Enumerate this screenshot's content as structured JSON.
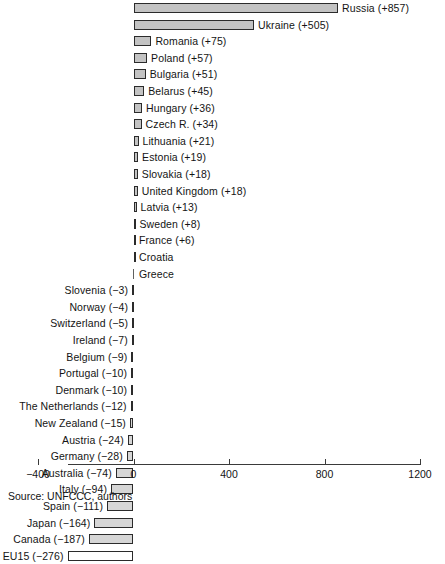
{
  "chart_data": {
    "type": "bar",
    "orientation": "horizontal",
    "title": "",
    "xlabel": "",
    "ylabel": "",
    "xlim": [
      -400,
      1200
    ],
    "xticks": [
      -400,
      0,
      400,
      800,
      1200
    ],
    "xtick_labels": [
      "−400",
      "0",
      "400",
      "800",
      "1200"
    ],
    "grid": false,
    "legend": "none",
    "categories": [
      "Russia",
      "Ukraine",
      "Romania",
      "Poland",
      "Bulgaria",
      "Belarus",
      "Hungary",
      "Czech R.",
      "Lithuania",
      "Estonia",
      "Slovakia",
      "United Kingdom",
      "Latvia",
      "Sweden",
      "France",
      "Croatia",
      "Greece",
      "Slovenia",
      "Norway",
      "Switzerland",
      "Ireland",
      "Belgium",
      "Portugal",
      "Denmark",
      "The Netherlands",
      "New Zealand",
      "Austria",
      "Germany",
      "Australia",
      "Italy",
      "Spain",
      "Japan",
      "Canada",
      "EU15"
    ],
    "values": [
      857,
      505,
      75,
      57,
      51,
      45,
      36,
      34,
      21,
      19,
      18,
      18,
      13,
      8,
      6,
      1,
      0,
      -3,
      -4,
      -5,
      -7,
      -9,
      -10,
      -10,
      -12,
      -15,
      -24,
      -28,
      -74,
      -94,
      -111,
      -164,
      -187,
      -276
    ],
    "bars": [
      {
        "name": "Russia",
        "value": 857,
        "label": "Russia (+857)"
      },
      {
        "name": "Ukraine",
        "value": 505,
        "label": "Ukraine (+505)"
      },
      {
        "name": "Romania",
        "value": 75,
        "label": "Romania (+75)"
      },
      {
        "name": "Poland",
        "value": 57,
        "label": "Poland (+57)"
      },
      {
        "name": "Bulgaria",
        "value": 51,
        "label": "Bulgaria (+51)"
      },
      {
        "name": "Belarus",
        "value": 45,
        "label": "Belarus (+45)"
      },
      {
        "name": "Hungary",
        "value": 36,
        "label": "Hungary (+36)"
      },
      {
        "name": "Czech R.",
        "value": 34,
        "label": "Czech R. (+34)"
      },
      {
        "name": "Lithuania",
        "value": 21,
        "label": "Lithuania (+21)"
      },
      {
        "name": "Estonia",
        "value": 19,
        "label": "Estonia (+19)"
      },
      {
        "name": "Slovakia",
        "value": 18,
        "label": "Slovakia (+18)"
      },
      {
        "name": "United Kingdom",
        "value": 18,
        "label": "United Kingdom (+18)"
      },
      {
        "name": "Latvia",
        "value": 13,
        "label": "Latvia (+13)"
      },
      {
        "name": "Sweden",
        "value": 8,
        "label": "Sweden (+8)"
      },
      {
        "name": "France",
        "value": 6,
        "label": "France (+6)"
      },
      {
        "name": "Croatia",
        "value": 1,
        "label": "Croatia"
      },
      {
        "name": "Greece",
        "value": 0,
        "label": "Greece"
      },
      {
        "name": "Slovenia",
        "value": -3,
        "label": "Slovenia (−3)"
      },
      {
        "name": "Norway",
        "value": -4,
        "label": "Norway (−4)"
      },
      {
        "name": "Switzerland",
        "value": -5,
        "label": "Switzerland (−5)"
      },
      {
        "name": "Ireland",
        "value": -7,
        "label": "Ireland (−7)"
      },
      {
        "name": "Belgium",
        "value": -9,
        "label": "Belgium (−9)"
      },
      {
        "name": "Portugal",
        "value": -10,
        "label": "Portugal (−10)"
      },
      {
        "name": "Denmark",
        "value": -10,
        "label": "Denmark (−10)"
      },
      {
        "name": "The Netherlands",
        "value": -12,
        "label": "The Netherlands (−12)"
      },
      {
        "name": "New Zealand",
        "value": -15,
        "label": "New Zealand (−15)"
      },
      {
        "name": "Austria",
        "value": -24,
        "label": "Austria (−24)"
      },
      {
        "name": "Germany",
        "value": -28,
        "label": "Germany (−28)"
      },
      {
        "name": "Australia",
        "value": -74,
        "label": "Australia (−74)"
      },
      {
        "name": "Italy",
        "value": -94,
        "label": "Italy (−94)"
      },
      {
        "name": "Spain",
        "value": -111,
        "label": "Spain (−111)"
      },
      {
        "name": "Japan",
        "value": -164,
        "label": "Japan (−164)"
      },
      {
        "name": "Canada",
        "value": -187,
        "label": "Canada (−187)"
      },
      {
        "name": "EU15",
        "value": -276,
        "label": "EU15 (−276)"
      }
    ],
    "colors": {
      "bar_fill": "#c3c3c3",
      "bar_fill_negative": "#d6d6d6",
      "bar_fill_eu15": "#ffffff",
      "bar_stroke": "#2b2b2b",
      "axis": "#3a3a3a",
      "text": "#141414",
      "background": "#ffffff"
    }
  },
  "source_note": "Source: UNFCCC, authors"
}
